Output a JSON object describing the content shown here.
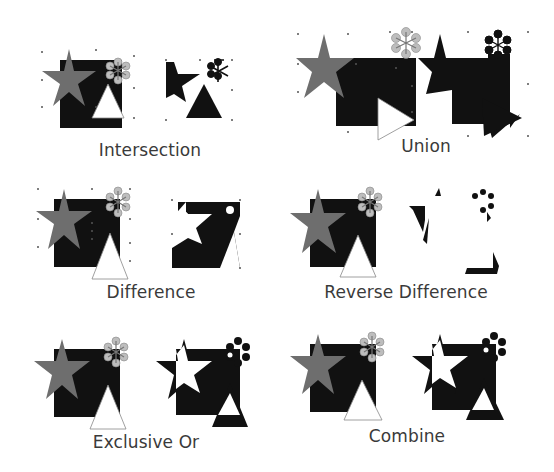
{
  "colors": {
    "square": "#111111",
    "star_source": "#6e6e6e",
    "flower_source": "#bdbdbd",
    "triangle_source": "#ffffff",
    "result": "#111111",
    "handle": "#555555",
    "caption": "#3a3a3a"
  },
  "shapes": [
    "square",
    "star",
    "flower",
    "triangle"
  ],
  "panels": [
    {
      "id": "intersection",
      "label": "Intersection"
    },
    {
      "id": "union",
      "label": "Union"
    },
    {
      "id": "difference",
      "label": "Difference"
    },
    {
      "id": "reverse-difference",
      "label": "Reverse Difference"
    },
    {
      "id": "exclusive-or",
      "label": "Exclusive Or"
    },
    {
      "id": "combine",
      "label": "Combine"
    }
  ]
}
